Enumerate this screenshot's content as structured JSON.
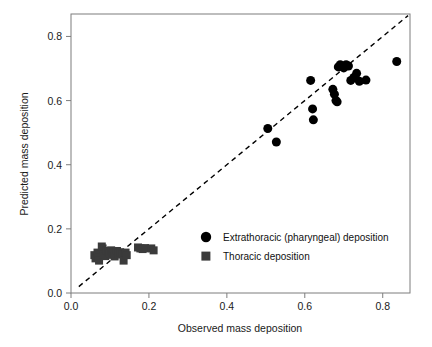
{
  "chart_data": {
    "type": "scatter",
    "title": "",
    "xlabel": "Observed mass deposition",
    "ylabel": "Predicted mass deposition",
    "xlim": [
      0.0,
      0.87
    ],
    "ylim": [
      0.0,
      0.87
    ],
    "xticks": [
      "0.0",
      "0.2",
      "0.4",
      "0.6",
      "0.8"
    ],
    "xtick_values": [
      0.0,
      0.2,
      0.4,
      0.6,
      0.8
    ],
    "yticks": [
      "0.0",
      "0.2",
      "0.4",
      "0.6",
      "0.8"
    ],
    "ytick_values": [
      0.0,
      0.2,
      0.4,
      0.6,
      0.8
    ],
    "grid": false,
    "legend_position": "center-right-lower",
    "reference_line": {
      "label": "identity line",
      "style": "dashed",
      "color": "#000000",
      "x0": 0.02,
      "y0": 0.02,
      "x1": 0.865,
      "y1": 0.865
    },
    "series": [
      {
        "name": "Extrathoracic (pharyngeal) deposition",
        "marker": "circle",
        "color": "#000000",
        "size": 9,
        "points": [
          [
            0.505,
            0.513
          ],
          [
            0.527,
            0.471
          ],
          [
            0.615,
            0.663
          ],
          [
            0.62,
            0.574
          ],
          [
            0.622,
            0.54
          ],
          [
            0.672,
            0.635
          ],
          [
            0.676,
            0.62
          ],
          [
            0.68,
            0.6
          ],
          [
            0.683,
            0.596
          ],
          [
            0.686,
            0.705
          ],
          [
            0.691,
            0.712
          ],
          [
            0.697,
            0.706
          ],
          [
            0.7,
            0.702
          ],
          [
            0.706,
            0.712
          ],
          [
            0.712,
            0.708
          ],
          [
            0.718,
            0.663
          ],
          [
            0.726,
            0.672
          ],
          [
            0.733,
            0.685
          ],
          [
            0.74,
            0.66
          ],
          [
            0.757,
            0.664
          ],
          [
            0.836,
            0.722
          ]
        ]
      },
      {
        "name": "Thoracic deposition",
        "marker": "square",
        "color": "#3b3b3b",
        "size": 8,
        "points": [
          [
            0.06,
            0.118
          ],
          [
            0.063,
            0.108
          ],
          [
            0.068,
            0.126
          ],
          [
            0.07,
            0.112
          ],
          [
            0.072,
            0.101
          ],
          [
            0.079,
            0.145
          ],
          [
            0.081,
            0.139
          ],
          [
            0.084,
            0.12
          ],
          [
            0.088,
            0.115
          ],
          [
            0.091,
            0.131
          ],
          [
            0.096,
            0.128
          ],
          [
            0.099,
            0.122
          ],
          [
            0.103,
            0.133
          ],
          [
            0.106,
            0.119
          ],
          [
            0.11,
            0.127
          ],
          [
            0.112,
            0.114
          ],
          [
            0.118,
            0.131
          ],
          [
            0.121,
            0.124
          ],
          [
            0.126,
            0.127
          ],
          [
            0.131,
            0.12
          ],
          [
            0.135,
            0.101
          ],
          [
            0.14,
            0.126
          ],
          [
            0.143,
            0.118
          ],
          [
            0.172,
            0.142
          ],
          [
            0.178,
            0.139
          ],
          [
            0.184,
            0.137
          ],
          [
            0.19,
            0.14
          ],
          [
            0.206,
            0.139
          ],
          [
            0.212,
            0.133
          ]
        ]
      }
    ]
  },
  "legend": {
    "entries": [
      {
        "label": "Extrathoracic (pharyngeal) deposition",
        "marker": "circle"
      },
      {
        "label": "Thoracic deposition",
        "marker": "square"
      }
    ]
  }
}
